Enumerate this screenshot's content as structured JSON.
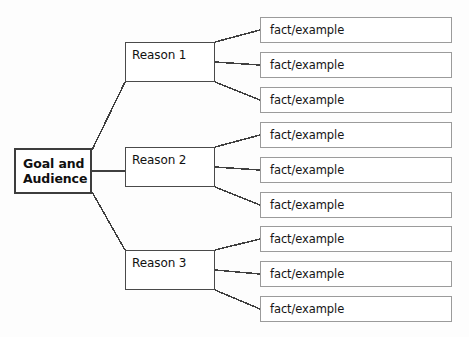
{
  "diagram": {
    "type": "tree-hierarchy",
    "title_visible": false,
    "background_color": "#fdfdfd",
    "root": {
      "id": "goal-and-audience",
      "label": "Goal and\nAudience",
      "label_line1": "Goal and",
      "label_line2": "Audience",
      "border_color": "#3d3d3d",
      "fill_color": "#ffffff",
      "bold": true,
      "x": 14,
      "y": 148,
      "width": 78,
      "height": 46
    },
    "branches": [
      {
        "id": "reason-1",
        "label": "Reason 1",
        "border_color": "#4a4a4a",
        "fill_color": "#ffffff",
        "x": 125,
        "y": 42,
        "width": 90,
        "height": 40,
        "leaves": [
          {
            "id": "fact-1-1",
            "label": "fact/example",
            "x": 260,
            "y": 17,
            "width": 192,
            "height": 26
          },
          {
            "id": "fact-1-2",
            "label": "fact/example",
            "x": 260,
            "y": 52,
            "width": 192,
            "height": 26
          },
          {
            "id": "fact-1-3",
            "label": "fact/example",
            "x": 260,
            "y": 87,
            "width": 192,
            "height": 26
          }
        ]
      },
      {
        "id": "reason-2",
        "label": "Reason 2",
        "border_color": "#4a4a4a",
        "fill_color": "#ffffff",
        "x": 125,
        "y": 147,
        "width": 90,
        "height": 40,
        "leaves": [
          {
            "id": "fact-2-1",
            "label": "fact/example",
            "x": 260,
            "y": 122,
            "width": 192,
            "height": 26
          },
          {
            "id": "fact-2-2",
            "label": "fact/example",
            "x": 260,
            "y": 157,
            "width": 192,
            "height": 26
          },
          {
            "id": "fact-2-3",
            "label": "fact/example",
            "x": 260,
            "y": 192,
            "width": 192,
            "height": 26
          }
        ]
      },
      {
        "id": "reason-3",
        "label": "Reason 3",
        "border_color": "#4a4a4a",
        "fill_color": "#ffffff",
        "x": 125,
        "y": 250,
        "width": 90,
        "height": 40,
        "leaves": [
          {
            "id": "fact-3-1",
            "label": "fact/example",
            "x": 260,
            "y": 226,
            "width": 192,
            "height": 26
          },
          {
            "id": "fact-3-2",
            "label": "fact/example",
            "x": 260,
            "y": 261,
            "width": 192,
            "height": 26
          },
          {
            "id": "fact-3-3",
            "label": "fact/example",
            "x": 260,
            "y": 296,
            "width": 192,
            "height": 26
          }
        ]
      }
    ],
    "connectors": {
      "stroke_color": "#3f3f3f",
      "stroke_width": 1.5,
      "root_to_branches": [
        {
          "from": "goal-and-audience",
          "to": "reason-1",
          "x1": 92,
          "y1": 150,
          "x2": 125,
          "y2": 82
        },
        {
          "from": "goal-and-audience",
          "to": "reason-2",
          "x1": 92,
          "y1": 171,
          "x2": 125,
          "y2": 171
        },
        {
          "from": "goal-and-audience",
          "to": "reason-3",
          "x1": 92,
          "y1": 192,
          "x2": 125,
          "y2": 250
        }
      ],
      "branches_to_leaves": [
        {
          "from": "reason-1",
          "to": "fact-1-1",
          "x1": 215,
          "y1": 42,
          "x2": 260,
          "y2": 30
        },
        {
          "from": "reason-1",
          "to": "fact-1-2",
          "x1": 215,
          "y1": 62,
          "x2": 260,
          "y2": 65
        },
        {
          "from": "reason-1",
          "to": "fact-1-3",
          "x1": 215,
          "y1": 82,
          "x2": 260,
          "y2": 100
        },
        {
          "from": "reason-2",
          "to": "fact-2-1",
          "x1": 215,
          "y1": 147,
          "x2": 260,
          "y2": 135
        },
        {
          "from": "reason-2",
          "to": "fact-2-2",
          "x1": 215,
          "y1": 167,
          "x2": 260,
          "y2": 170
        },
        {
          "from": "reason-2",
          "to": "fact-2-3",
          "x1": 215,
          "y1": 187,
          "x2": 260,
          "y2": 205
        },
        {
          "from": "reason-3",
          "to": "fact-3-1",
          "x1": 215,
          "y1": 250,
          "x2": 260,
          "y2": 239
        },
        {
          "from": "reason-3",
          "to": "fact-3-2",
          "x1": 215,
          "y1": 270,
          "x2": 260,
          "y2": 274
        },
        {
          "from": "reason-3",
          "to": "fact-3-3",
          "x1": 215,
          "y1": 290,
          "x2": 260,
          "y2": 309
        }
      ]
    }
  }
}
